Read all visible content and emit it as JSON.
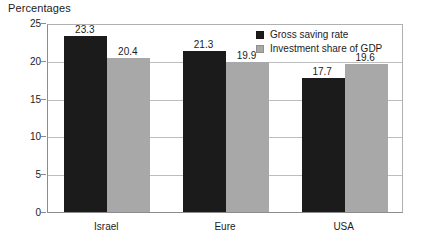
{
  "chart_data": {
    "type": "bar",
    "title": "Percentages",
    "xlabel": "",
    "ylabel": "",
    "ylim": [
      0,
      25
    ],
    "yticks": [
      "0",
      "5",
      "10",
      "15",
      "20",
      "25"
    ],
    "grid": true,
    "legend_position": "top-right",
    "categories": [
      "Israel",
      "Eure",
      "USA"
    ],
    "series": [
      {
        "name": "Gross saving rate",
        "color": "#1b1b1b",
        "values": [
          23.3,
          21.3,
          17.7
        ],
        "labels": [
          "23.3",
          "21.3",
          "17.7"
        ]
      },
      {
        "name": "Investment share of GDP",
        "color": "#a8a8a8",
        "values": [
          20.4,
          19.9,
          19.6
        ],
        "labels": [
          "20.4",
          "19.9",
          "19.6"
        ]
      }
    ]
  },
  "legend": {
    "items": [
      {
        "label": "Gross saving rate",
        "swatch": "legend-swatch-dark"
      },
      {
        "label": "Investment share of GDP",
        "swatch": "legend-swatch-light"
      }
    ]
  }
}
